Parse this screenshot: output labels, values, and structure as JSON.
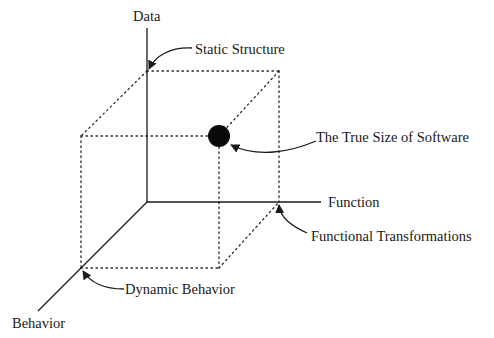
{
  "diagram": {
    "type": "3d-cube-model",
    "axes": {
      "data": {
        "label": "Data"
      },
      "function": {
        "label": "Function"
      },
      "behavior": {
        "label": "Behavior"
      }
    },
    "annotations": {
      "static_structure": "Static Structure",
      "true_size": "The True Size of Software",
      "functional_transformations": "Functional Transformations",
      "dynamic_behavior": "Dynamic Behavior"
    },
    "colors": {
      "line": "#1a1a1a",
      "point": "#0a0a0a",
      "background": "#ffffff"
    }
  }
}
